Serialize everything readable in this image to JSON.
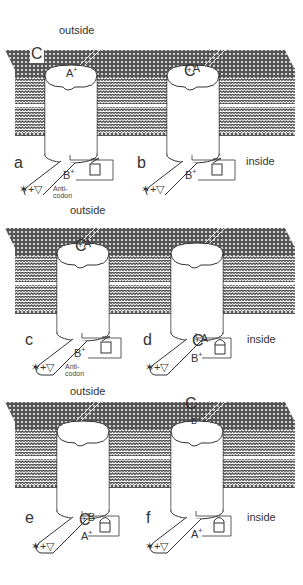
{
  "figure": {
    "panels": [
      {
        "id": "top",
        "outside_label": "outside",
        "inside_label": "inside",
        "channels": [
          {
            "letter": "a",
            "pore_label": "A",
            "pore_sup": "+",
            "free_C": "C",
            "base_label": "B",
            "base_sup": "+",
            "lock": "open",
            "tail": "✶+▽",
            "anticodon": [
              "Anti-",
              "codon"
            ]
          },
          {
            "letter": "b",
            "pore_label": "A",
            "pore_C": "C",
            "pore_sup": "+",
            "base_label": "B",
            "base_sup": "+",
            "lock": "open",
            "tail": "✶+▽"
          }
        ]
      },
      {
        "id": "middle",
        "outside_label": "outside",
        "inside_label": "inside",
        "channels": [
          {
            "letter": "c",
            "pore_label": "A",
            "pore_C": "C",
            "pore_sup": "+",
            "base_label": "B",
            "base_sup": "+",
            "lock": "open",
            "tail": "✶+▽",
            "anticodon": [
              "Anti-",
              "codon"
            ]
          },
          {
            "letter": "d",
            "base_C": "C",
            "base_C_label": "A",
            "base_sup": "+",
            "base_label": "B",
            "base_label_sup": "+",
            "lock": "closed",
            "tail": "✶+▽"
          }
        ]
      },
      {
        "id": "bottom",
        "outside_label": "outside",
        "inside_label": "inside",
        "channels": [
          {
            "letter": "e",
            "base_C": "C",
            "base_C_label": "B",
            "base_sup": "+",
            "base_label": "A",
            "base_label_sup": "+",
            "lock": "closed",
            "tail": "✶+▽"
          },
          {
            "letter": "f",
            "top_C": "C",
            "pore_label": "B",
            "pore_sup": "+",
            "base_label": "A",
            "base_label_sup": "+",
            "lock": "closed",
            "tail": "✶+▽"
          }
        ]
      }
    ]
  }
}
